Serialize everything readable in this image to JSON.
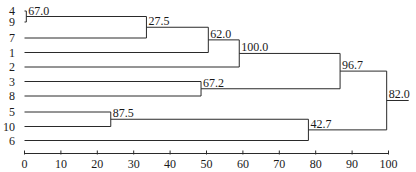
{
  "chart_data": {
    "type": "dendrogram",
    "title": "",
    "xlabel": "",
    "ylabel": "",
    "xlim": [
      0,
      100
    ],
    "x_ticks": [
      0,
      10,
      20,
      30,
      40,
      50,
      60,
      70,
      80,
      90,
      100
    ],
    "leaves": [
      "4",
      "9",
      "7",
      "1",
      "2",
      "3",
      "8",
      "5",
      "10",
      "6"
    ],
    "merges": [
      {
        "id": "n1",
        "children": [
          "4",
          "9"
        ],
        "height": 0.5,
        "label": "67.0"
      },
      {
        "id": "n2",
        "children": [
          "n1",
          "7"
        ],
        "height": 33.5,
        "label": "27.5"
      },
      {
        "id": "n3",
        "children": [
          "n2",
          "1"
        ],
        "height": 50.5,
        "label": "62.0"
      },
      {
        "id": "n4",
        "children": [
          "n3",
          "2"
        ],
        "height": 59,
        "label": "100.0"
      },
      {
        "id": "n5",
        "children": [
          "3",
          "8"
        ],
        "height": 48.5,
        "label": "67.2"
      },
      {
        "id": "n6",
        "children": [
          "n4",
          "n5"
        ],
        "height": 86.7,
        "label": "96.7"
      },
      {
        "id": "n7",
        "children": [
          "5",
          "10"
        ],
        "height": 23.7,
        "label": "87.5"
      },
      {
        "id": "n8",
        "children": [
          "n7",
          "6"
        ],
        "height": 78,
        "label": "42.7"
      },
      {
        "id": "n9",
        "children": [
          "n6",
          "n8"
        ],
        "height": 99.5,
        "label": "82.0"
      }
    ],
    "grid": false,
    "legend": null
  },
  "colors": {
    "line": "#2a2a2a",
    "text": "#1a1a1a",
    "background": "#ffffff"
  }
}
